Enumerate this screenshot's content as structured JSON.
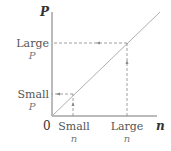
{
  "diagram": {
    "y_axis_label": "P",
    "x_axis_label": "n",
    "origin_label": "0",
    "y_ticks": [
      {
        "line1": "Large",
        "line2": "P"
      },
      {
        "line1": "Small",
        "line2": "P"
      }
    ],
    "x_ticks": [
      {
        "line1": "Small",
        "line2": "n"
      },
      {
        "line1": "Large",
        "line2": "n"
      }
    ],
    "relationship": "P proportional to n (straight line through origin)",
    "points": [
      {
        "name": "small",
        "n": "Small n",
        "P": "Small P"
      },
      {
        "name": "large",
        "n": "Large n",
        "P": "Large P"
      }
    ],
    "colors": {
      "axes": "#777777",
      "line": "#aaaaaa",
      "dashed": "#888888",
      "text": "#555555"
    }
  }
}
